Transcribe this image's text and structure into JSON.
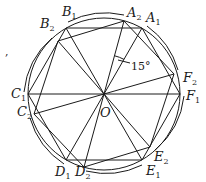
{
  "figure": {
    "center": {
      "label": "O",
      "x": 104,
      "y": 94
    },
    "radius": 76,
    "rotation_annotation": "15°",
    "stray_mark": ",",
    "hexagon_1": [
      {
        "name": "A",
        "sub": "1",
        "x": 142,
        "y": 28
      },
      {
        "name": "B",
        "sub": "1",
        "x": 66,
        "y": 28
      },
      {
        "name": "C",
        "sub": "1",
        "x": 28,
        "y": 94
      },
      {
        "name": "D",
        "sub": "1",
        "x": 66,
        "y": 160
      },
      {
        "name": "E",
        "sub": "1",
        "x": 142,
        "y": 160
      },
      {
        "name": "F",
        "sub": "1",
        "x": 180,
        "y": 94
      }
    ],
    "hexagon_2": [
      {
        "name": "A",
        "sub": "2",
        "x": 124,
        "y": 21
      },
      {
        "name": "B",
        "sub": "2",
        "x": 58,
        "y": 41
      },
      {
        "name": "C",
        "sub": "2",
        "x": 34,
        "y": 114
      },
      {
        "name": "D",
        "sub": "2",
        "x": 84,
        "y": 167
      },
      {
        "name": "E",
        "sub": "2",
        "x": 150,
        "y": 147
      },
      {
        "name": "F",
        "sub": "2",
        "x": 174,
        "y": 74
      }
    ],
    "labels": [
      {
        "id": "A1",
        "letter": "A",
        "sub": "1",
        "x": 146,
        "y": 22
      },
      {
        "id": "A2",
        "letter": "A",
        "sub": "2",
        "x": 127,
        "y": 17
      },
      {
        "id": "B1",
        "letter": "B",
        "sub": "1",
        "x": 62,
        "y": 16
      },
      {
        "id": "B2",
        "letter": "B",
        "sub": "2",
        "x": 40,
        "y": 28
      },
      {
        "id": "C1",
        "letter": "C",
        "sub": "1",
        "x": 11,
        "y": 98
      },
      {
        "id": "C2",
        "letter": "C",
        "sub": "2",
        "x": 17,
        "y": 116
      },
      {
        "id": "D1",
        "letter": "D",
        "sub": "1",
        "x": 55,
        "y": 176
      },
      {
        "id": "D2",
        "letter": "D",
        "sub": "2",
        "x": 75,
        "y": 176
      },
      {
        "id": "E1",
        "letter": "E",
        "sub": "1",
        "x": 146,
        "y": 175
      },
      {
        "id": "E2",
        "letter": "E",
        "sub": "2",
        "x": 154,
        "y": 161
      },
      {
        "id": "F1",
        "letter": "F",
        "sub": "1",
        "x": 186,
        "y": 100
      },
      {
        "id": "F2",
        "letter": "F",
        "sub": "2",
        "x": 183,
        "y": 82
      },
      {
        "id": "O",
        "letter": "O",
        "sub": "",
        "x": 104,
        "y": 117
      }
    ]
  }
}
